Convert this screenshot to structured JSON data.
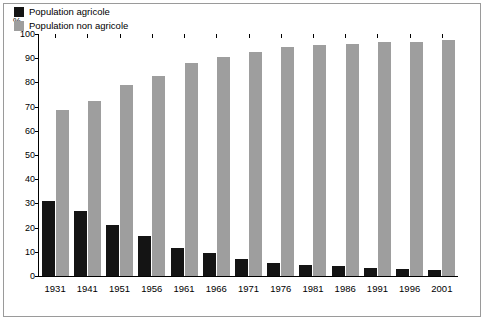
{
  "chart_data": {
    "type": "bar",
    "title": "",
    "subtitle": "",
    "unit_label": "%",
    "xlabel": "",
    "ylabel": "",
    "ylim": [
      0,
      100
    ],
    "yticks": [
      0,
      10,
      20,
      30,
      40,
      50,
      60,
      70,
      80,
      90,
      100
    ],
    "grid": false,
    "legend_position": "top-left",
    "categories": [
      "1931",
      "1941",
      "1951",
      "1956",
      "1961",
      "1966",
      "1971",
      "1976",
      "1981",
      "1986",
      "1991",
      "1996",
      "2001"
    ],
    "series": [
      {
        "name": "Population agricole",
        "color": "#141414",
        "values": [
          31,
          27,
          21,
          16.5,
          11.5,
          9.5,
          7,
          5.5,
          4.5,
          4,
          3.5,
          3,
          2.5
        ]
      },
      {
        "name": "Population non agricole",
        "color": "#9e9e9e",
        "values": [
          68.5,
          72.5,
          79,
          82.5,
          88,
          90.5,
          92.5,
          94.5,
          95.5,
          96,
          96.5,
          96.5,
          97.5
        ]
      }
    ]
  }
}
